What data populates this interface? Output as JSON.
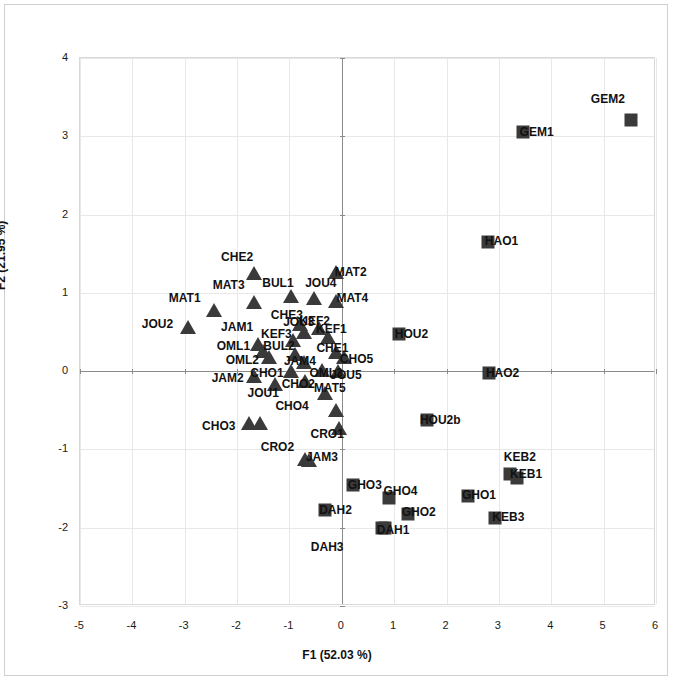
{
  "chart_data": {
    "type": "scatter",
    "title": "",
    "xlabel": "F1 (52.03 %)",
    "ylabel": "F2 (21.95 %)",
    "xlim": [
      -5,
      6
    ],
    "ylim": [
      -3,
      4
    ],
    "xticks": [
      -5,
      -4,
      -3,
      -2,
      -1,
      0,
      1,
      2,
      3,
      4,
      5,
      6
    ],
    "yticks": [
      -3,
      -2,
      -1,
      0,
      1,
      2,
      3,
      4
    ],
    "xtick_labels": [
      "-5",
      "-4",
      "-3",
      "-2",
      "-1",
      "0",
      "1",
      "2",
      "3",
      "4",
      "5",
      "6"
    ],
    "ytick_labels": [
      "-3",
      "-2",
      "-1",
      "0",
      "1",
      "2",
      "3",
      "4"
    ],
    "grid": true,
    "legend": "none",
    "marker_color": "#3a3a3a",
    "series": [
      {
        "name": "triangles",
        "marker": "triangle",
        "points": [
          {
            "label": "CHE2",
            "x": -1.68,
            "y": 1.25,
            "lx": -2.0,
            "ly": 1.46
          },
          {
            "label": "MAT2",
            "x": -0.12,
            "y": 1.27,
            "lx": 0.17,
            "ly": 1.27
          },
          {
            "label": "MAT3",
            "x": -1.68,
            "y": 0.88,
            "lx": -2.16,
            "ly": 1.1
          },
          {
            "label": "BUL1",
            "x": -0.97,
            "y": 0.96,
            "lx": -1.22,
            "ly": 1.12
          },
          {
            "label": "JOU4",
            "x": -0.53,
            "y": 0.94,
            "lx": -0.4,
            "ly": 1.12
          },
          {
            "label": "MAT1",
            "x": -2.45,
            "y": 0.78,
            "lx": -3.0,
            "ly": 0.93
          },
          {
            "label": "MAT4",
            "x": -0.12,
            "y": 0.9,
            "lx": 0.2,
            "ly": 0.94
          },
          {
            "label": "JOU2",
            "x": -2.93,
            "y": 0.57,
            "lx": -3.52,
            "ly": 0.6
          },
          {
            "label": "CHE3",
            "x": -0.8,
            "y": 0.6,
            "lx": -1.05,
            "ly": 0.72
          },
          {
            "label": "JOU3",
            "x": -0.73,
            "y": 0.5,
            "lx": -0.82,
            "ly": 0.63
          },
          {
            "label": "KEF2",
            "x": -0.44,
            "y": 0.55,
            "lx": -0.52,
            "ly": 0.64
          },
          {
            "label": "JAM1",
            "x": -1.6,
            "y": 0.35,
            "lx": -2.0,
            "ly": 0.56
          },
          {
            "label": "KEF3",
            "x": -0.93,
            "y": 0.4,
            "lx": -1.25,
            "ly": 0.47
          },
          {
            "label": "KEF1",
            "x": -0.27,
            "y": 0.43,
            "lx": -0.2,
            "ly": 0.54
          },
          {
            "label": "OML1",
            "x": -1.51,
            "y": 0.26,
            "lx": -2.07,
            "ly": 0.32
          },
          {
            "label": "BUL2",
            "x": -0.9,
            "y": 0.22,
            "lx": -1.2,
            "ly": 0.32
          },
          {
            "label": "CHE1",
            "x": -0.12,
            "y": 0.25,
            "lx": -0.18,
            "ly": 0.3
          },
          {
            "label": "OML2",
            "x": -1.4,
            "y": 0.18,
            "lx": -1.9,
            "ly": 0.14
          },
          {
            "label": "JAM4",
            "x": -0.73,
            "y": 0.12,
            "lx": -0.8,
            "ly": 0.13
          },
          {
            "label": "CHO5",
            "x": 0.05,
            "y": 0.18,
            "lx": 0.28,
            "ly": 0.16
          },
          {
            "label": "CHO1",
            "x": -0.98,
            "y": 0.0,
            "lx": -1.43,
            "ly": -0.03
          },
          {
            "label": "OML3",
            "x": -0.38,
            "y": 0.02,
            "lx": -0.3,
            "ly": -0.03
          },
          {
            "label": "JOU5",
            "x": -0.07,
            "y": 0.0,
            "lx": 0.08,
            "ly": -0.05
          },
          {
            "label": "JAM2",
            "x": -1.68,
            "y": -0.06,
            "lx": -2.18,
            "ly": -0.09
          },
          {
            "label": "CHO2",
            "x": -0.7,
            "y": -0.12,
            "lx": -0.83,
            "ly": -0.17
          },
          {
            "label": "JOU1",
            "x": -1.27,
            "y": -0.17,
            "lx": -1.5,
            "ly": -0.28
          },
          {
            "label": "MAT5",
            "x": -0.33,
            "y": -0.28,
            "lx": -0.23,
            "ly": -0.21
          },
          {
            "label": "CHO4",
            "x": -0.12,
            "y": -0.5,
            "lx": -0.95,
            "ly": -0.45
          },
          {
            "label": "CHO3",
            "x": -1.78,
            "y": -0.66,
            "lx": -2.35,
            "ly": -0.7
          },
          {
            "label": "CHO3b",
            "x": -1.57,
            "y": -0.66,
            "lx": null,
            "ly": null
          },
          {
            "label": "CRO1",
            "x": -0.06,
            "y": -0.73,
            "lx": -0.28,
            "ly": -0.8
          },
          {
            "label": "CRO2",
            "x": -0.7,
            "y": -1.12,
            "lx": -1.23,
            "ly": -0.97
          },
          {
            "label": "JAM3",
            "x": -0.62,
            "y": -1.13,
            "lx": -0.38,
            "ly": -1.1
          }
        ]
      },
      {
        "name": "squares",
        "marker": "square",
        "points": [
          {
            "label": "GEM2",
            "x": 5.53,
            "y": 3.21,
            "lx": 5.08,
            "ly": 3.48
          },
          {
            "label": "GEM1",
            "x": 3.46,
            "y": 3.05,
            "lx": 3.72,
            "ly": 3.05
          },
          {
            "label": "HAO1",
            "x": 2.8,
            "y": 1.65,
            "lx": 3.05,
            "ly": 1.66
          },
          {
            "label": "HOU2",
            "x": 1.09,
            "y": 0.47,
            "lx": 1.33,
            "ly": 0.47
          },
          {
            "label": "HAO2",
            "x": 2.82,
            "y": -0.02,
            "lx": 3.07,
            "ly": -0.02
          },
          {
            "label": "HOU2b",
            "x": 1.62,
            "y": -0.62,
            "lx": 1.88,
            "ly": -0.62
          },
          {
            "label": "KEB2",
            "x": 3.22,
            "y": -1.32,
            "lx": 3.4,
            "ly": -1.1
          },
          {
            "label": "KEB1",
            "x": 3.35,
            "y": -1.37,
            "lx": 3.52,
            "ly": -1.32
          },
          {
            "label": "GHO3",
            "x": 0.21,
            "y": -1.45,
            "lx": 0.44,
            "ly": -1.45
          },
          {
            "label": "GHO1",
            "x": 2.41,
            "y": -1.6,
            "lx": 2.62,
            "ly": -1.58
          },
          {
            "label": "GHO4",
            "x": 0.9,
            "y": -1.62,
            "lx": 1.12,
            "ly": -1.53
          },
          {
            "label": "DAH2",
            "x": -0.33,
            "y": -1.77,
            "lx": -0.12,
            "ly": -1.78
          },
          {
            "label": "GHO2",
            "x": 1.26,
            "y": -1.82,
            "lx": 1.47,
            "ly": -1.8
          },
          {
            "label": "KEB3",
            "x": 2.93,
            "y": -1.88,
            "lx": 3.18,
            "ly": -1.86
          },
          {
            "label": "DAH1",
            "x": 0.76,
            "y": -2.0,
            "lx": 0.98,
            "ly": -2.03
          },
          {
            "label": "DAH3",
            "x": 0.83,
            "y": -2.0,
            "lx": -0.28,
            "ly": -2.24
          }
        ]
      }
    ]
  }
}
